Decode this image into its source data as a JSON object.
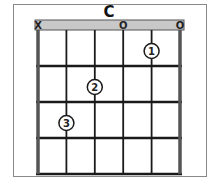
{
  "chord": {
    "name": "C",
    "strings": 6,
    "frets": 4,
    "string_markers": [
      "X",
      "",
      "",
      "O",
      "",
      "O"
    ],
    "fingers": [
      {
        "label": "1",
        "string": 5,
        "fret": 1
      },
      {
        "label": "2",
        "string": 3,
        "fret": 2
      },
      {
        "label": "3",
        "string": 2,
        "fret": 3
      }
    ]
  },
  "colors": {
    "nut_fill": "#c8c8c8",
    "line": "#1a1a1a",
    "frame": "#555555",
    "background": "#ffffff"
  }
}
